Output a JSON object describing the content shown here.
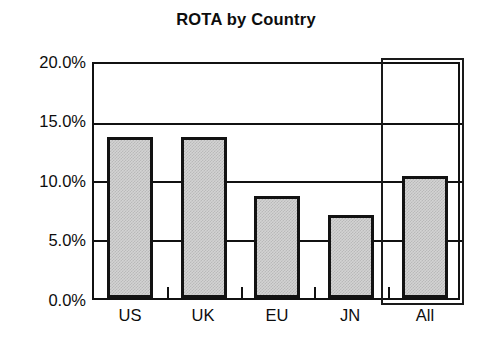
{
  "chart_data": {
    "type": "bar",
    "title": "ROTA by Country",
    "xlabel": "",
    "ylabel": "",
    "categories": [
      "US",
      "UK",
      "EU",
      "JN",
      "All"
    ],
    "values": [
      13.8,
      13.8,
      8.7,
      7.1,
      10.4
    ],
    "value_unit": "%",
    "ylim": [
      0.0,
      20.0
    ],
    "yticks": [
      0.0,
      5.0,
      10.0,
      15.0,
      20.0
    ],
    "ytick_labels": [
      "0.0%",
      "5.0%",
      "10.0%",
      "15.0%",
      "20.0%"
    ],
    "grid": true,
    "legend": "none",
    "annotations": [
      {
        "name": "all-highlight-box",
        "type": "rectangle",
        "target_category": "All",
        "description": "black rectangle outlining the All column"
      }
    ],
    "colors": {
      "bar_fill": "#d3d3d3",
      "bar_border": "#121212",
      "axis": "#111111",
      "text": "#0d0d0d",
      "background": "#ffffff"
    }
  },
  "axis": {
    "ytick_labels": [
      "20.0%",
      "15.0%",
      "10.0%",
      "5.0%",
      "0.0%"
    ],
    "xcat_labels": [
      "US",
      "UK",
      "EU",
      "JN",
      "All"
    ]
  }
}
